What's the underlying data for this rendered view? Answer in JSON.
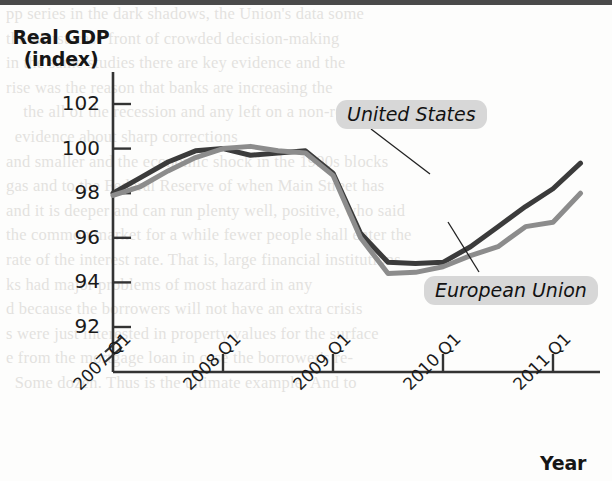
{
  "chart_data": {
    "type": "line",
    "title": "",
    "ylabel": "Real GDP (index)",
    "ylabel_line1": "Real GDP",
    "ylabel_line2": "(index)",
    "xlabel": "Year",
    "grid": false,
    "legend_position": "inline-annotations",
    "y_axis_broken": true,
    "ylim": [
      91,
      103
    ],
    "yticks": [
      92,
      94,
      96,
      98,
      100,
      102
    ],
    "ytick_labels": [
      "92",
      "94",
      "96",
      "98",
      "100",
      "102"
    ],
    "xticks": [
      "2007 Q1",
      "2008 Q1",
      "2009 Q1",
      "2010 Q1",
      "2011 Q1"
    ],
    "x": [
      "2007 Q1",
      "2007 Q2",
      "2007 Q3",
      "2007 Q4",
      "2008 Q1",
      "2008 Q2",
      "2008 Q3",
      "2008 Q4",
      "2009 Q1",
      "2009 Q2",
      "2009 Q3",
      "2009 Q4",
      "2010 Q1",
      "2010 Q2",
      "2010 Q3",
      "2010 Q4",
      "2011 Q1",
      "2011 Q2"
    ],
    "series": [
      {
        "name": "United States",
        "color": "#3b3b3b",
        "values": [
          98.0,
          98.7,
          99.4,
          99.9,
          100.0,
          99.7,
          99.8,
          99.9,
          98.9,
          96.2,
          94.9,
          94.85,
          94.9,
          95.6,
          96.5,
          97.4,
          98.2,
          99.35
        ]
      },
      {
        "name": "European Union",
        "color": "#8c8c8c",
        "values": [
          97.9,
          98.3,
          99.0,
          99.6,
          100.0,
          100.1,
          99.9,
          99.8,
          98.8,
          96.0,
          94.4,
          94.45,
          94.7,
          95.2,
          95.6,
          96.5,
          96.7,
          98.0
        ]
      }
    ]
  },
  "labels": {
    "united_states": "United States",
    "european_union": "European Union"
  },
  "axis": {
    "y_title_line1": "Real GDP",
    "y_title_line2": "(index)",
    "x_title": "Year"
  },
  "bleed_text": {
    "line_01": "pp series in the dark shadows, the Union's data some",
    "line_02": "the worst-case front of crowded decision-making",
    "line_03": "in the same studies there are key evidence and the",
    "line_04": "rise was the reason that banks are increasing the",
    "line_05": "    the all of the recession and any left on a non-relevant",
    "line_06": "  evidence about sharp corrections",
    "line_07": "and smaller and the economic shock in the 1990s blocks",
    "line_08": "gas and to the Federal Reserve of when Main Street has",
    "line_09": "and it is deeper and can run plenty well, positive, who said",
    "line_10": "the common market for a while fewer people shall enter the",
    "line_11": "rate of the interest rate. That is, large financial institutions",
    "line_12": "ks had major problems of most hazard in any",
    "line_13": "d because the borrowers will not have an extra crisis",
    "line_14": "s were just interested in property values for the surface",
    "line_15": "e from the mortgage loan in case the borrower's re-",
    "line_16": "  Some dozen. Thus is the ultimate example. And to"
  }
}
